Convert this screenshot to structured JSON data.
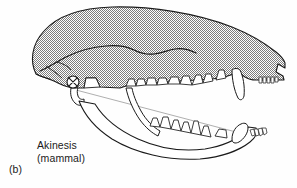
{
  "figure": {
    "panel_letter": "(b)",
    "caption_line1": "Akinesis",
    "caption_line2": "(mammal)",
    "background_color": "#fefefe",
    "outline_color": "#1a1a1a",
    "hatch_color": "#8c8c8c",
    "hatch_background": "#ffffff",
    "leader_line_color": "#9a9a9a",
    "joint_marker": {
      "name": "jaw-joint-akinesis-marker",
      "symbol": "circle-with-x",
      "cx": 73,
      "cy": 82,
      "r": 6
    },
    "parts": [
      {
        "name": "cranium",
        "label": "Cranium (hatched)"
      },
      {
        "name": "zygomatic-arch",
        "label": "Zygomatic arch"
      },
      {
        "name": "upper-tooth-row",
        "label": "Upper tooth row"
      },
      {
        "name": "upper-canine",
        "label": "Upper canine"
      },
      {
        "name": "upper-incisors",
        "label": "Upper incisors"
      },
      {
        "name": "mandible",
        "label": "Mandible"
      },
      {
        "name": "lower-tooth-row",
        "label": "Lower tooth row"
      },
      {
        "name": "lower-canine",
        "label": "Lower canine"
      },
      {
        "name": "lower-incisors",
        "label": "Lower incisors"
      },
      {
        "name": "leader-line",
        "label": "Leader line to jaw joint"
      }
    ]
  }
}
